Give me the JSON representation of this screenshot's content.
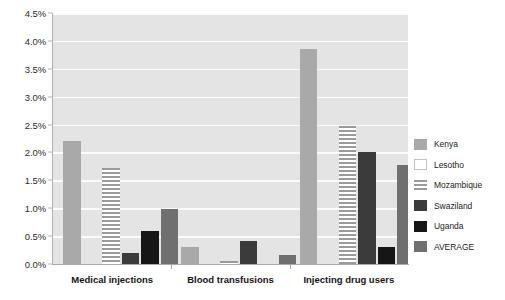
{
  "chart_data": {
    "type": "bar",
    "title": "",
    "subtitle": "",
    "xlabel": "",
    "ylabel": "",
    "categories": [
      "Medical injections",
      "Blood transfusions",
      "Injecting drug users"
    ],
    "series": [
      {
        "name": "Kenya",
        "color": "#a9a9a9",
        "fill": "solid",
        "values": [
          2.2,
          0.3,
          3.85
        ]
      },
      {
        "name": "Lesotho",
        "color": "#ffffff",
        "fill": "solid",
        "values": [
          0.0,
          0.0,
          0.0
        ]
      },
      {
        "name": "Mozambique",
        "color": "#9a9a9a",
        "fill": "horizontal-stripes",
        "values": [
          1.72,
          0.05,
          2.47
        ]
      },
      {
        "name": "Swaziland",
        "color": "#3b3b3b",
        "fill": "solid",
        "values": [
          0.2,
          0.42,
          2.0
        ]
      },
      {
        "name": "Uganda",
        "color": "#161616",
        "fill": "solid",
        "values": [
          0.6,
          0.0,
          0.3
        ]
      },
      {
        "name": "AVERAGE",
        "color": "#6f6f6f",
        "fill": "solid",
        "values": [
          0.98,
          0.17,
          1.78
        ]
      }
    ],
    "ylim": [
      0.0,
      4.5
    ],
    "ytick_step": 0.5,
    "ytick_labels": [
      "0.0%",
      "0.5%",
      "1.0%",
      "1.5%",
      "2.0%",
      "2.5%",
      "3.0%",
      "3.5%",
      "4.0%",
      "4.5%"
    ],
    "value_unit": "percent",
    "grid": "horizontal",
    "gridline_color": "#fbfbfb",
    "plot_background": "#e4e4e4",
    "legend_position": "right"
  }
}
